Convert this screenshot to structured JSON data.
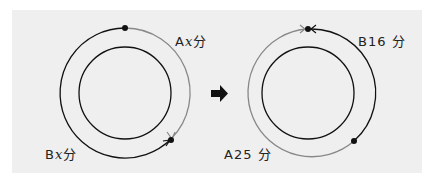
{
  "colors": {
    "background": "#efefef",
    "path_b": "#111111",
    "path_a": "#888888",
    "inner_circle": "#111111"
  },
  "left_diagram": {
    "label_a": {
      "runner": "A",
      "var": "x",
      "unit": "分"
    },
    "label_b": {
      "runner": "B",
      "var": "x",
      "unit": "分"
    }
  },
  "transition_arrow": "right-arrow",
  "right_diagram": {
    "label_b": {
      "runner": "B",
      "value": "16",
      "unit": "分"
    },
    "label_a": {
      "runner": "A",
      "value": "25",
      "unit": "分"
    }
  }
}
